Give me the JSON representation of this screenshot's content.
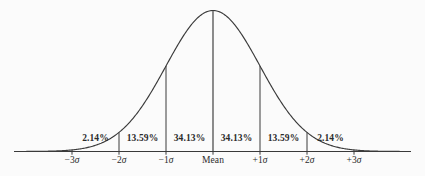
{
  "figure": {
    "name": "normal-distribution-bell-curve",
    "background_color": "#fbfbfb",
    "line_color": "#3a3a3a",
    "text_color": "#2b2b2b"
  },
  "chart_data": {
    "type": "area",
    "title": "",
    "subtitle": "",
    "xlabel": "",
    "ylabel": "",
    "grid": false,
    "legend": null,
    "curve": {
      "distribution": "normal",
      "mean": 0,
      "sigma": 1,
      "xlim": [
        -4.2,
        4.2
      ],
      "ylim": [
        0,
        1
      ]
    },
    "x_ticks": [
      -3,
      -2,
      -1,
      0,
      1,
      2,
      3
    ],
    "x_tick_labels": [
      "−3σ",
      "−2σ",
      "−1σ",
      "Mean",
      "+1σ",
      "+2σ",
      "+3σ"
    ],
    "dividers_at_sigma": [
      -3,
      -2,
      -1,
      0,
      1,
      2,
      3
    ],
    "categories": [
      "−3σ to −2σ",
      "−2σ to −1σ",
      "−1σ to Mean",
      "Mean to +1σ",
      "+1σ to +2σ",
      "+2σ to +3σ"
    ],
    "values": [
      2.14,
      13.59,
      34.13,
      34.13,
      13.59,
      2.14
    ],
    "value_labels": [
      "2.14%",
      "13.59%",
      "34.13%",
      "34.13%",
      "13.59%",
      "2.14%"
    ]
  },
  "bands": [
    {
      "id": "band-minus3-minus2",
      "label": "2.14%",
      "center_sigma": -2.5,
      "value": 2.14
    },
    {
      "id": "band-minus2-minus1",
      "label": "13.59%",
      "center_sigma": -1.5,
      "value": 13.59
    },
    {
      "id": "band-minus1-mean",
      "label": "34.13%",
      "center_sigma": -0.5,
      "value": 34.13
    },
    {
      "id": "band-mean-plus1",
      "label": "34.13%",
      "center_sigma": 0.5,
      "value": 34.13
    },
    {
      "id": "band-plus1-plus2",
      "label": "13.59%",
      "center_sigma": 1.5,
      "value": 13.59
    },
    {
      "id": "band-plus2-plus3",
      "label": "2.14%",
      "center_sigma": 2.5,
      "value": 2.14
    }
  ],
  "axis_ticks": [
    {
      "id": "tick-minus3",
      "sign": "−",
      "num": "3",
      "sigma": "σ",
      "value": -3
    },
    {
      "id": "tick-minus2",
      "sign": "−",
      "num": "2",
      "sigma": "σ",
      "value": -2
    },
    {
      "id": "tick-minus1",
      "sign": "−",
      "num": "1",
      "sigma": "σ",
      "value": -1
    },
    {
      "id": "tick-mean",
      "sign": "",
      "num": "Mean",
      "sigma": "",
      "value": 0
    },
    {
      "id": "tick-plus1",
      "sign": "+",
      "num": "1",
      "sigma": "σ",
      "value": 1
    },
    {
      "id": "tick-plus2",
      "sign": "+",
      "num": "2",
      "sigma": "σ",
      "value": 2
    },
    {
      "id": "tick-plus3",
      "sign": "+",
      "num": "3",
      "sigma": "σ",
      "value": 3
    }
  ]
}
